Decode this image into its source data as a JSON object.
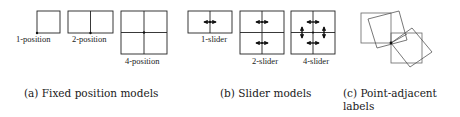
{
  "figure": {
    "panels": [
      {
        "id": "a",
        "caption": "(a) Fixed position models",
        "models": [
          {
            "label": "1-position",
            "grid": "1x1",
            "box": [
              37,
              11,
              23,
              22
            ],
            "point": [
              37,
              33
            ]
          },
          {
            "label": "2-position",
            "grid": "2x1",
            "box": [
              68,
              11,
              45,
              22
            ],
            "point": [
              90.5,
              33
            ]
          },
          {
            "label": "4-position",
            "grid": "2x2",
            "box": [
              121,
              11,
              46,
              43
            ],
            "point": [
              144,
              32.5
            ]
          }
        ]
      },
      {
        "id": "b",
        "caption": "(b) Slider models",
        "models": [
          {
            "label": "1-slider",
            "box": [
              188,
              11,
              44,
              22
            ],
            "arrows": "horizontal x1"
          },
          {
            "label": "2-slider",
            "box": [
              240,
              11,
              44,
              43
            ],
            "arrows": "horizontal x2"
          },
          {
            "label": "4-slider",
            "box": [
              291,
              11,
              44,
              43
            ],
            "arrows": "horizontal x2, vertical x2"
          }
        ]
      },
      {
        "id": "c",
        "caption_line1": "(c) Point-adjacent",
        "caption_line2": "labels",
        "point": [
          391,
          43
        ],
        "note": "axis-aligned and rotated squares sharing a corner at the point"
      }
    ],
    "colors": {
      "stroke": "#222222",
      "tilted_stroke": "#555555",
      "text": "#1a1a1a",
      "background": "#ffffff"
    },
    "icons": {
      "horizontal_slider": "double-arrow-horizontal",
      "vertical_slider": "double-arrow-vertical",
      "anchor_point": "filled-dot"
    }
  }
}
